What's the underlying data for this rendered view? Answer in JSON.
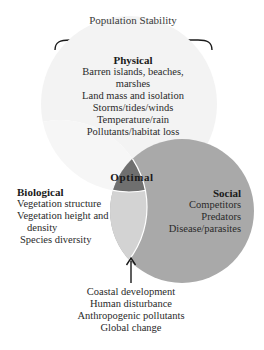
{
  "title": "Population Stability",
  "colors": {
    "physical_fill": "#f3f3f3",
    "social_fill": "#a9a9a9",
    "biological_fill": "#ffffff",
    "bio_social_overlap": "#d3d3d3",
    "optimal_fill": "#6f6f6f",
    "stroke": "#ffffff",
    "brace": "#1a1a1a"
  },
  "physical": {
    "heading": "Physical",
    "items": [
      "Barren islands, beaches,",
      "marshes",
      "Land mass and isolation",
      "Storms/tides/winds",
      "Temperature/rain",
      "Pollutants/habitat loss"
    ]
  },
  "biological": {
    "heading": "Biological",
    "items": [
      "Vegetation structure",
      "Vegetation height and",
      "density",
      "Species diversity"
    ]
  },
  "social": {
    "heading": "Social",
    "items": [
      "Competitors",
      "Predators",
      "Disease/parasites"
    ]
  },
  "optimal": {
    "label": "Optimal"
  },
  "anthropogenic": {
    "items": [
      "Coastal development",
      "Human disturbance",
      "Anthropogenic pollutants",
      "Global change"
    ]
  }
}
